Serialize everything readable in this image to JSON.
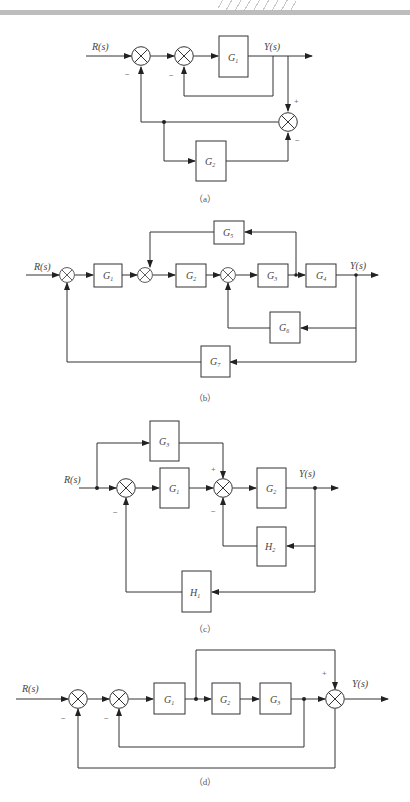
{
  "diagrams": {
    "a": {
      "caption": "（a）",
      "input": "R(s)",
      "output": "Y(s)",
      "blocks": {
        "g1": {
          "name": "G",
          "sub": "1"
        },
        "g2": {
          "name": "G",
          "sub": "2"
        }
      },
      "signs": {
        "sum1_bottom": "−",
        "sum2_bottom": "−",
        "sum3_top": "+",
        "sum3_bottom": "−"
      }
    },
    "b": {
      "caption": "（b）",
      "input": "R(s)",
      "output": "Y(s)",
      "blocks": {
        "g1": {
          "name": "G",
          "sub": "1"
        },
        "g2": {
          "name": "G",
          "sub": "2"
        },
        "g3": {
          "name": "G",
          "sub": "3"
        },
        "g4": {
          "name": "G",
          "sub": "4"
        },
        "g5": {
          "name": "G",
          "sub": "5"
        },
        "g6": {
          "name": "G",
          "sub": "6"
        },
        "g7": {
          "name": "G",
          "sub": "7"
        }
      }
    },
    "c": {
      "caption": "（c）",
      "input": "R(s)",
      "output": "Y(s)",
      "blocks": {
        "g1": {
          "name": "G",
          "sub": "1"
        },
        "g2": {
          "name": "G",
          "sub": "2"
        },
        "g3": {
          "name": "G",
          "sub": "3"
        },
        "h1": {
          "name": "H",
          "sub": "1"
        },
        "h2": {
          "name": "H",
          "sub": "2"
        }
      },
      "signs": {
        "sum1_bottom": "−",
        "sum2_top": "+",
        "sum2_bottom": "−"
      }
    },
    "d": {
      "caption": "（d）",
      "input": "R(s)",
      "output": "Y(s)",
      "blocks": {
        "g1": {
          "name": "G",
          "sub": "1"
        },
        "g2": {
          "name": "G",
          "sub": "2"
        },
        "g3": {
          "name": "G",
          "sub": "3"
        }
      },
      "signs": {
        "sum1_bottom": "−",
        "sum2_bottom": "−",
        "sum3_top": "+"
      }
    }
  }
}
